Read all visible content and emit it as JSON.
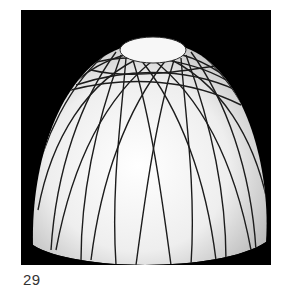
{
  "figure": {
    "background_color": "#000000",
    "surface_color": "#f2f2f2",
    "line_color": "#1a1a1a"
  },
  "caption": {
    "number": "29"
  }
}
